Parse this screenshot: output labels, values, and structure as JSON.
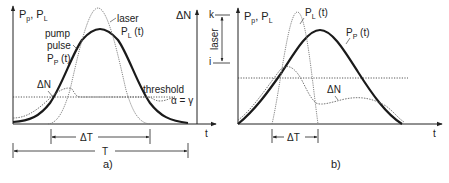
{
  "panel_a": {
    "caption": "a)",
    "y_axis_label_main": "P",
    "y_axis_sub1": "p",
    "y_axis_sep": ", P",
    "y_axis_sub2": "L",
    "x_axis_label": "t",
    "laser_label_line1": "laser",
    "laser_label_line2_main": "P",
    "laser_label_line2_sub": "L",
    "laser_label_line2_rest": " (t)",
    "pump_label_line1": "pump",
    "pump_label_line2": "pulse",
    "pump_label_line3_main": "P",
    "pump_label_line3_sub": "P",
    "pump_label_line3_rest": " (t)",
    "threshold_label": "threshold",
    "delta_n_label": "ΔN",
    "delta_t_label": "ΔT",
    "period_label": "T",
    "inset": {
      "axis_label": "ΔN",
      "upper_level": "k",
      "lower_level": "i",
      "band_label": "laser",
      "condition_label": "α = γ",
      "x_axis_label": "t"
    }
  },
  "panel_b": {
    "caption": "b)",
    "y_axis_label_main": "P",
    "y_axis_sub1": "p",
    "y_axis_sep": ", P",
    "y_axis_sub2": "L",
    "x_axis_label": "t",
    "laser_label_main": "P",
    "laser_label_sub": "L",
    "laser_label_rest": " (t)",
    "pump_label_main": "P",
    "pump_label_sub": "P",
    "pump_label_rest": " (t)",
    "delta_n_label": "ΔN",
    "delta_t_label": "ΔT"
  },
  "colors": {
    "pump_curve": "#1a1a1a",
    "laser_curve": "#777777",
    "delta_n_curve": "#666666",
    "threshold_line": "#444444"
  }
}
